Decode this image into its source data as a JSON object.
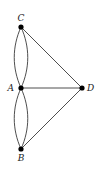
{
  "diagram": {
    "type": "graph",
    "nodes": [
      {
        "id": "C",
        "label": "C",
        "x": 21,
        "y": 27
      },
      {
        "id": "A",
        "label": "A",
        "x": 21,
        "y": 88
      },
      {
        "id": "D",
        "label": "D",
        "x": 82,
        "y": 88
      },
      {
        "id": "B",
        "label": "B",
        "x": 21,
        "y": 149
      }
    ],
    "edges": [
      {
        "from": "A",
        "to": "C",
        "kind": "curve-left"
      },
      {
        "from": "A",
        "to": "C",
        "kind": "curve-right"
      },
      {
        "from": "A",
        "to": "B",
        "kind": "curve-left"
      },
      {
        "from": "A",
        "to": "B",
        "kind": "curve-right"
      },
      {
        "from": "A",
        "to": "D",
        "kind": "straight"
      },
      {
        "from": "C",
        "to": "D",
        "kind": "straight"
      },
      {
        "from": "B",
        "to": "D",
        "kind": "straight"
      }
    ],
    "colors": {
      "edge": "#3a3a3a",
      "node": "#000000",
      "label": "#222222"
    }
  }
}
